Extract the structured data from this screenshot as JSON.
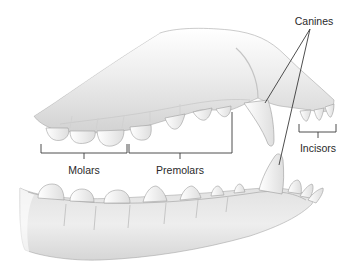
{
  "diagram": {
    "labels": {
      "canines": "Canines",
      "incisors": "Incisors",
      "molars": "Molars",
      "premolars": "Premolars"
    },
    "label_positions": {
      "canines": {
        "x": 314,
        "y": 16
      },
      "incisors": {
        "x": 318,
        "y": 144
      },
      "molars": {
        "x": 84,
        "y": 165
      },
      "premolars": {
        "x": 180,
        "y": 165
      }
    },
    "brackets": {
      "molars": {
        "x1": 41,
        "x2": 127,
        "y_top": 144,
        "y_line": 153,
        "stem": 159
      },
      "premolars": {
        "x1": 129,
        "x2": 232,
        "y_top_left": 144,
        "y_top_right": 112,
        "y_line": 153,
        "stem": 159
      },
      "incisors": {
        "x1": 299,
        "x2": 336,
        "y_top": 124,
        "y_line": 132,
        "stem": 138
      }
    },
    "leader_lines": {
      "origin": {
        "x": 310,
        "y": 29
      },
      "upper_canine": {
        "x": 265,
        "y": 103
      },
      "lower_canine": {
        "x": 279,
        "y": 165
      }
    },
    "colors": {
      "bone_light": "#f4f4f4",
      "bone_mid": "#dcdcdc",
      "bone_shadow": "#b9b9b9",
      "outline": "#9a9a9a",
      "tooth": "#fafafa",
      "line": "#3a3a3a",
      "text": "#2a2a2a"
    }
  }
}
